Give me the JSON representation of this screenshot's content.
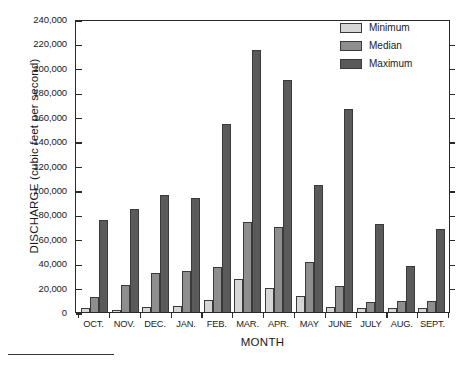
{
  "chart_data": {
    "type": "bar",
    "title": "",
    "xlabel": "MONTH",
    "ylabel": "DISCHARGE (cubic feet per second)",
    "categories": [
      "OCT.",
      "NOV.",
      "DEC.",
      "JAN.",
      "FEB.",
      "MAR.",
      "APR.",
      "MAY",
      "JUNE",
      "JULY",
      "AUG.",
      "SEPT."
    ],
    "series": [
      {
        "name": "Minimum",
        "color": "#d6d6d6",
        "values": [
          3000,
          2000,
          4000,
          5000,
          10000,
          27000,
          20000,
          13000,
          4000,
          3000,
          3000,
          3000
        ]
      },
      {
        "name": "Median",
        "color": "#8e8e8e",
        "values": [
          12000,
          22000,
          32000,
          34000,
          37000,
          74000,
          70000,
          41000,
          21000,
          8000,
          9000,
          9000
        ]
      },
      {
        "name": "Maximum",
        "color": "#5a5a5a",
        "values": [
          75000,
          84000,
          96000,
          93000,
          154000,
          215000,
          190000,
          104000,
          166000,
          72000,
          38000,
          68000
        ]
      }
    ],
    "ylim": [
      0,
      240000
    ],
    "ytick_step": 20000,
    "ytick_labels": [
      "240,000",
      "220,000",
      "200,000",
      "180,000",
      "160,000",
      "140,000",
      "120,000",
      "100,000",
      "80,000",
      "60,000",
      "40,000",
      "20,000",
      "0"
    ],
    "ytick_values": [
      240000,
      220000,
      200000,
      180000,
      160000,
      140000,
      120000,
      100000,
      80000,
      60000,
      40000,
      20000,
      0
    ],
    "grid": false,
    "legend_position": "top-right",
    "legend_entries": [
      "Minimum",
      "Median",
      "Maximum"
    ]
  }
}
